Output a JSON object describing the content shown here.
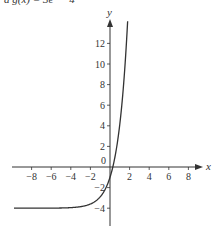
{
  "caption": "a g(x) = 3eˣ − 4",
  "chart_data": {
    "type": "line",
    "title": "",
    "function": "g(x) = 3e^x - 4",
    "xlabel": "x",
    "ylabel": "y",
    "xlim": [
      -9,
      9
    ],
    "ylim": [
      -5,
      13
    ],
    "x_ticks": [
      -8,
      -6,
      -4,
      -2,
      2,
      4,
      6,
      8
    ],
    "y_ticks": [
      -4,
      -2,
      2,
      4,
      6,
      8,
      10,
      12
    ],
    "origin_label": "0",
    "grid": false,
    "series": [
      {
        "name": "g(x)",
        "x": [
          -9.8,
          -8,
          -6,
          -4,
          -3,
          -2,
          -1.5,
          -1,
          -0.5,
          0,
          0.29,
          0.5,
          1,
          1.5,
          1.84
        ],
        "values": [
          -4.0,
          -3.999,
          -3.993,
          -3.945,
          -3.851,
          -3.594,
          -3.331,
          -2.896,
          -2.18,
          -1.0,
          0.0,
          0.946,
          4.155,
          9.445,
          14.9
        ]
      }
    ],
    "asymptote": -4,
    "y_intercept": -1,
    "x_intercept": 0.29
  }
}
